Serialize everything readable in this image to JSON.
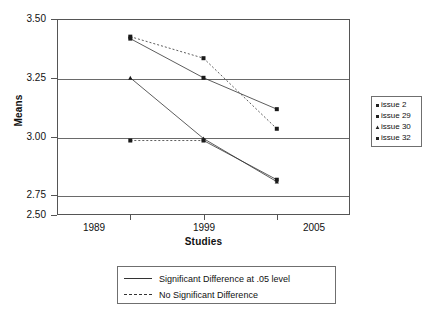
{
  "chart_data": {
    "type": "line",
    "title": "",
    "xlabel": "Studies",
    "ylabel": "Means",
    "categories": [
      "1989",
      "1999",
      "2005"
    ],
    "ylim": [
      2.5,
      3.5
    ],
    "yticks": [
      "3.50",
      "3.25",
      "3.00",
      "2.75",
      "2.50"
    ],
    "ytick_values": [
      3.5,
      3.25,
      3.0,
      2.75,
      2.5
    ],
    "gridlines": [
      3.25,
      3.0,
      2.75
    ],
    "grid": true,
    "legend_position": "right",
    "series": [
      {
        "name": "issue 2",
        "values": [
          3.41,
          3.3,
          2.94
        ],
        "linestyle": "dashed",
        "marker": "square"
      },
      {
        "name": "issue 29",
        "values": [
          3.4,
          3.2,
          3.04
        ],
        "linestyle": "solid",
        "marker": "square"
      },
      {
        "name": "issue 30",
        "values": [
          3.2,
          2.89,
          2.67
        ],
        "linestyle": "solid",
        "marker": "triangle"
      },
      {
        "name": "issue 32",
        "values": [
          2.88,
          2.88,
          2.68
        ],
        "linestyle": "mixed",
        "marker": "square"
      }
    ],
    "style_legend": [
      {
        "label": "Significant Difference at .05 level",
        "linestyle": "solid"
      },
      {
        "label": "No Significant Difference",
        "linestyle": "dashed"
      }
    ]
  },
  "colors": {
    "line": "#333333",
    "axis": "#555555",
    "grid": "#6a6a6a",
    "text": "#111111",
    "background": "#ffffff"
  }
}
